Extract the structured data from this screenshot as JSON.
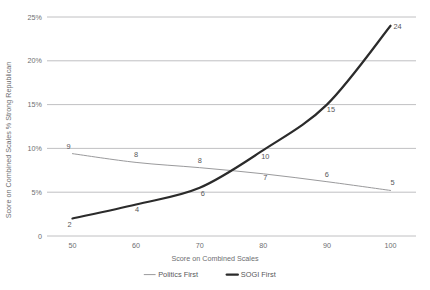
{
  "chart_data": {
    "type": "line",
    "title": "",
    "xlabel": "Score on Combined Scales",
    "ylabel": "Score on Combined Scales % Strong Republican",
    "x": [
      50,
      60,
      70,
      80,
      90,
      100
    ],
    "xticklabels": [
      "50",
      "60",
      "70",
      "80",
      "90",
      "100"
    ],
    "yticklabels": [
      "0",
      "5%",
      "10%",
      "15%",
      "20%",
      "25%"
    ],
    "ytickvalues": [
      0,
      5,
      10,
      15,
      20,
      25
    ],
    "xlim": [
      46,
      104
    ],
    "ylim": [
      0,
      25
    ],
    "grid": "horizontal",
    "legend_position": "bottom",
    "series": [
      {
        "name": "Politics First",
        "color": "#9a9a9c",
        "width": 1.0,
        "values": [
          9.4,
          8.4,
          7.8,
          7.1,
          6.2,
          5.2
        ],
        "point_labels": [
          "9",
          "8",
          "8",
          "7",
          "6",
          "5"
        ],
        "label_offsets": [
          [
            -4,
            -5
          ],
          [
            0,
            -5
          ],
          [
            0,
            -5
          ],
          [
            2,
            6
          ],
          [
            0,
            -5
          ],
          [
            2,
            -5
          ]
        ]
      },
      {
        "name": "SOGI First",
        "color": "#2b2b2b",
        "width": 2.2,
        "values": [
          2.0,
          3.6,
          5.5,
          9.8,
          15.0,
          24.0
        ],
        "point_labels": [
          "2",
          "4",
          "6",
          "10",
          "15",
          "24"
        ],
        "label_offsets": [
          [
            -3,
            9
          ],
          [
            1,
            8
          ],
          [
            3,
            8
          ],
          [
            2,
            9
          ],
          [
            4,
            7
          ],
          [
            7,
            3
          ]
        ]
      }
    ]
  },
  "legend": {
    "items": [
      {
        "label": "Politics First",
        "color": "#9a9a9c",
        "width": 1.0
      },
      {
        "label": "SOGI First",
        "color": "#2b2b2b",
        "width": 2.4
      }
    ]
  }
}
